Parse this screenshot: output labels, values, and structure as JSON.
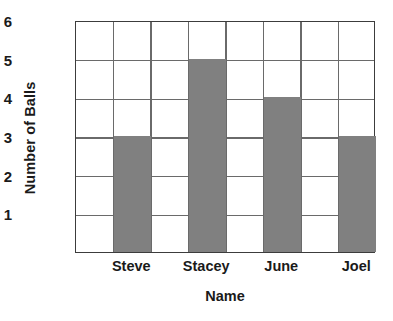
{
  "chart_data": {
    "type": "bar",
    "title": "",
    "xlabel": "Name",
    "ylabel": "Number of Balls",
    "categories": [
      "Steve",
      "Stacey",
      "June",
      "Joel"
    ],
    "values": [
      3,
      5,
      4,
      3
    ],
    "series": [
      {
        "name": "Number of Balls",
        "values": [
          3,
          5,
          4,
          3
        ]
      }
    ],
    "ylim": [
      0,
      6
    ],
    "y_ticks": [
      6,
      5,
      4,
      3,
      2,
      1
    ],
    "y_tick_labels": [
      "6",
      "5",
      "4",
      "3",
      "2",
      "1"
    ],
    "grid": true,
    "grid_columns": 8,
    "legend": "none",
    "bar_color": "#808080",
    "grid_color": "#6a6a6a",
    "axis_color": "#3c3c3c",
    "background_color": "#ffffff"
  },
  "axes": {
    "y_title": "Number of Balls",
    "x_title": "Name"
  }
}
